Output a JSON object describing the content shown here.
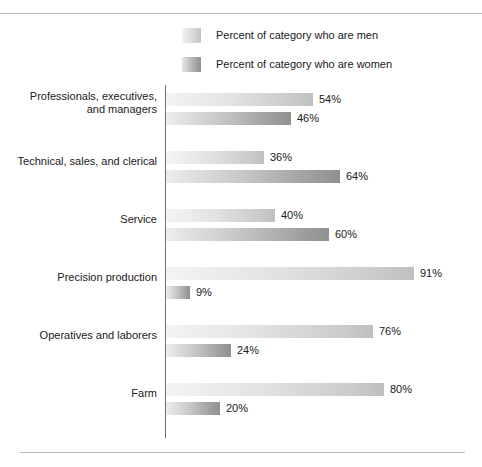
{
  "chart_data": {
    "type": "bar",
    "orientation": "horizontal",
    "title": "",
    "subtitle": "",
    "xlabel": "",
    "ylabel": "",
    "xlim": [
      0,
      100
    ],
    "grid": false,
    "legend_position": "top-center",
    "value_suffix": "%",
    "categories": [
      "Professionals, executives, and managers",
      "Technical, sales, and clerical",
      "Service",
      "Precision production",
      "Operatives and laborers",
      "Farm"
    ],
    "category_lines": [
      [
        "Professionals, executives,",
        "and managers"
      ],
      [
        "Technical, sales, and clerical"
      ],
      [
        "Service"
      ],
      [
        "Precision production"
      ],
      [
        "Operatives and laborers"
      ],
      [
        "Farm"
      ]
    ],
    "series": [
      {
        "name": "Percent of category who are men",
        "key": "men",
        "values": [
          54,
          36,
          40,
          91,
          76,
          80
        ],
        "labels": [
          "54%",
          "36%",
          "40%",
          "91%",
          "76%",
          "80%"
        ],
        "color_start": "#f4f4f4",
        "color_end": "#bfbfbf"
      },
      {
        "name": "Percent of category who are women",
        "key": "women",
        "values": [
          46,
          64,
          60,
          9,
          24,
          20
        ],
        "labels": [
          "46%",
          "64%",
          "60%",
          "9%",
          "24%",
          "20%"
        ],
        "color_start": "#ededed",
        "color_end": "#909090"
      }
    ]
  },
  "legend": {
    "items": [
      {
        "label": "Percent of category who are men",
        "swatch": "men"
      },
      {
        "label": "Percent of category who are women",
        "swatch": "women"
      }
    ]
  },
  "colors": {
    "axis_line": "#6e6e6e",
    "rule": "#b9b9b9",
    "text": "#202020",
    "background": "#ffffff"
  }
}
